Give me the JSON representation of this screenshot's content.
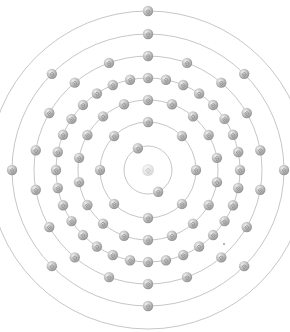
{
  "diagram": {
    "type": "bohr-atom-model",
    "center": [
      148,
      170
    ],
    "nucleus": {
      "icon": "nucleus-swirl-icon",
      "radius": 6,
      "color": "#d4d4d4"
    },
    "electron": {
      "icon": "electron-sphere-icon",
      "radius": 5.2,
      "color": "#a9a9a9",
      "highlight": "#eeeeee",
      "swirl": "#8a8a8a"
    },
    "orbit_color": "#b8b8b8",
    "shells": [
      {
        "n": 1,
        "radius": 24,
        "electrons": 2,
        "angles": [
          -115,
          65
        ]
      },
      {
        "n": 2,
        "radius": 48,
        "electrons": 8,
        "start_angle": -90
      },
      {
        "n": 3,
        "radius": 70,
        "electrons": 18,
        "start_angle": -90
      },
      {
        "n": 4,
        "radius": 92,
        "electrons": 32,
        "start_angle": -90
      },
      {
        "n": 5,
        "radius": 114,
        "electrons": 18,
        "start_angle": -90
      },
      {
        "n": 6,
        "radius": 136,
        "electrons": 8,
        "start_angle": -90
      },
      {
        "n": 7,
        "radius": 159,
        "electrons": 1,
        "angles": [
          -90
        ]
      }
    ],
    "electron_configuration": [
      2,
      8,
      18,
      32,
      18,
      8,
      1
    ],
    "total_electrons": 87
  }
}
